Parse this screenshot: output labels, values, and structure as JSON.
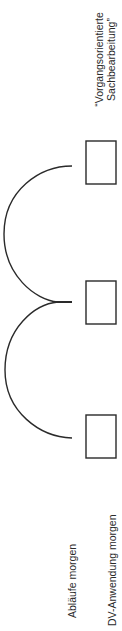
{
  "diagram": {
    "type": "process-flow",
    "orientation": "rotated-90",
    "nodes": [
      {
        "id": "box-top",
        "label": ""
      },
      {
        "id": "box-middle",
        "label": ""
      },
      {
        "id": "box-bottom",
        "label": ""
      }
    ],
    "connectors": [
      {
        "from": "box-top",
        "to": "box-middle",
        "shape": "arc"
      },
      {
        "from": "box-middle",
        "to": "box-bottom",
        "shape": "arc"
      }
    ],
    "labels": {
      "top_line1": "“Vorgangsorientierte",
      "top_line2": "Sachbearbeitung”",
      "bottom_left": "Abläufe morgen",
      "bottom_right": "DV-Anwendung morgen"
    },
    "colors": {
      "stroke": "#2a2a2a",
      "background": "#ffffff"
    }
  }
}
